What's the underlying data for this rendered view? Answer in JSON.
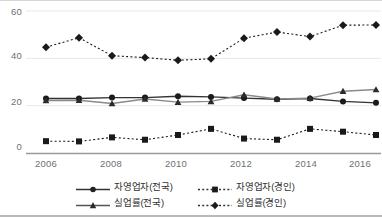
{
  "chart_data": {
    "type": "line",
    "title": "",
    "xlabel": "",
    "ylabel": "",
    "x": [
      2006,
      2007,
      2008,
      2009,
      2010,
      2011,
      2012,
      2013,
      2014,
      2015,
      2016
    ],
    "xtick_labels": [
      "2006",
      "2008",
      "2010",
      "2012",
      "2014",
      "2016"
    ],
    "xticks": [
      2006,
      2008,
      2010,
      2012,
      2014,
      2016
    ],
    "ytick_labels": [
      "0",
      "20",
      "40",
      "60"
    ],
    "yticks": [
      0,
      20,
      40,
      60
    ],
    "ylim": [
      0,
      60
    ],
    "xlim": [
      2006,
      2016
    ],
    "grid": true,
    "legend_position": "bottom",
    "series": [
      {
        "name": "자영업자(전국)",
        "marker": "circle",
        "linestyle": "solid",
        "color": "#333333",
        "values": [
          23.0,
          23.0,
          23.4,
          23.4,
          24.0,
          23.7,
          23.2,
          22.7,
          23.0,
          21.8,
          21.2
        ]
      },
      {
        "name": "자영업자(경인)",
        "marker": "square",
        "linestyle": "dotted",
        "color": "#1a1a1a",
        "values": [
          5.0,
          4.9,
          6.6,
          5.6,
          7.6,
          10.2,
          6.1,
          5.6,
          10.2,
          9.0,
          7.6
        ]
      },
      {
        "name": "실업률(전국)",
        "marker": "triangle",
        "linestyle": "solid",
        "color": "#8a8a8a",
        "values": [
          22.2,
          22.3,
          20.9,
          22.8,
          21.5,
          21.8,
          24.6,
          22.8,
          23.2,
          26.1,
          26.8
        ]
      },
      {
        "name": "실업률(경인)",
        "marker": "diamond",
        "linestyle": "dotted",
        "color": "#1a1a1a",
        "values": [
          44.7,
          48.7,
          41.1,
          40.3,
          39.2,
          39.8,
          48.5,
          51.1,
          49.2,
          54.0,
          54.1
        ]
      }
    ]
  },
  "legend": {
    "items": [
      {
        "label": "자영업자(전국)",
        "marker": "circle-marker",
        "style": "solid"
      },
      {
        "label": "자영업자(경인)",
        "marker": "square-marker",
        "style": "dotted"
      },
      {
        "label": "실업률(전국)",
        "marker": "triangle-marker",
        "style": "solid"
      },
      {
        "label": "실업률(경인)",
        "marker": "diamond-marker",
        "style": "dotted"
      }
    ]
  }
}
